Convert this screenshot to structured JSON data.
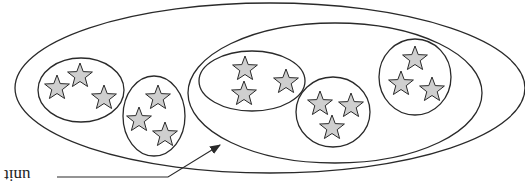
{
  "diagram": {
    "label": "unit",
    "label_orientation": "rotated-180",
    "colors": {
      "stroke": "#2a2a2a",
      "star_fill": "#cfcfcf",
      "background": "#ffffff"
    },
    "outer_ellipse": {
      "cx": 270,
      "cy": 88,
      "rx": 255,
      "ry": 85
    },
    "inner_ellipse": {
      "cx": 335,
      "cy": 93,
      "rx": 147,
      "ry": 70
    },
    "clusters": [
      {
        "cx": 81,
        "cy": 90,
        "rx": 43,
        "ry": 32,
        "stars": [
          [
            57,
            88
          ],
          [
            80,
            76
          ],
          [
            104,
            98
          ]
        ]
      },
      {
        "cx": 154,
        "cy": 116,
        "rx": 31,
        "ry": 40,
        "stars": [
          [
            158,
            98
          ],
          [
            139,
            120
          ],
          [
            165,
            135
          ]
        ]
      },
      {
        "cx": 252,
        "cy": 81,
        "rx": 53,
        "ry": 30,
        "stars": [
          [
            245,
            69
          ],
          [
            244,
            94
          ],
          [
            286,
            82
          ]
        ]
      },
      {
        "cx": 333,
        "cy": 112,
        "rx": 37,
        "ry": 35,
        "stars": [
          [
            320,
            104
          ],
          [
            351,
            106
          ],
          [
            332,
            128
          ]
        ]
      },
      {
        "cx": 415,
        "cy": 77,
        "rx": 36,
        "ry": 38,
        "stars": [
          [
            415,
            59
          ],
          [
            401,
            84
          ],
          [
            432,
            90
          ]
        ]
      }
    ],
    "pointer": {
      "from": [
        57,
        177
      ],
      "elbow": [
        168,
        177
      ],
      "to": [
        220,
        145
      ]
    }
  }
}
